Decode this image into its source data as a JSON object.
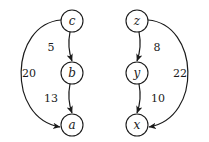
{
  "diagram": {
    "type": "weighted-directed-graphs",
    "graphs": [
      {
        "nodes": [
          {
            "id": "c",
            "label": "c",
            "x": 72,
            "y": 21
          },
          {
            "id": "b",
            "label": "b",
            "x": 72,
            "y": 73
          },
          {
            "id": "a",
            "label": "a",
            "x": 72,
            "y": 125
          }
        ],
        "edges": [
          {
            "from": "c",
            "to": "b",
            "weight": "5"
          },
          {
            "from": "b",
            "to": "a",
            "weight": "13"
          },
          {
            "from": "c",
            "to": "a",
            "weight": "20"
          }
        ]
      },
      {
        "nodes": [
          {
            "id": "z",
            "label": "z",
            "x": 137,
            "y": 21
          },
          {
            "id": "y",
            "label": "y",
            "x": 137,
            "y": 73
          },
          {
            "id": "x",
            "label": "x",
            "x": 137,
            "y": 125
          }
        ],
        "edges": [
          {
            "from": "z",
            "to": "y",
            "weight": "8"
          },
          {
            "from": "y",
            "to": "x",
            "weight": "10"
          },
          {
            "from": "z",
            "to": "x",
            "weight": "22"
          }
        ]
      }
    ]
  },
  "labels": {
    "c": "c",
    "b": "b",
    "a": "a",
    "z": "z",
    "y": "y",
    "x": "x",
    "w_cb": "5",
    "w_ba": "13",
    "w_ca": "20",
    "w_zy": "8",
    "w_yx": "10",
    "w_zx": "22"
  }
}
